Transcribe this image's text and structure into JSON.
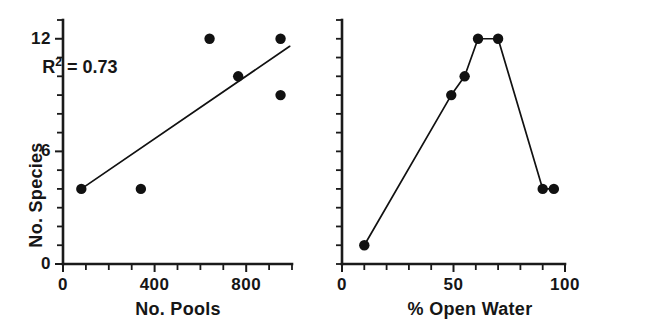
{
  "figure": {
    "background_color": "#ffffff",
    "ink_color": "#111111",
    "panel_count": 2
  },
  "chart_data": [
    {
      "type": "scatter",
      "panel": "left",
      "title": "",
      "xlabel": "No. Pools",
      "ylabel": "No. Species",
      "xlim": [
        0,
        1000
      ],
      "ylim": [
        0,
        13
      ],
      "grid": false,
      "legend": "none",
      "x_ticks": [
        0,
        100,
        200,
        300,
        400,
        500,
        600,
        700,
        800,
        900,
        1000
      ],
      "x_ticklabels": [
        {
          "value": 0,
          "label": "0"
        },
        {
          "value": 400,
          "label": "400"
        },
        {
          "value": 800,
          "label": "800"
        }
      ],
      "y_ticks": [
        0,
        1,
        2,
        3,
        4,
        5,
        6,
        7,
        8,
        9,
        10,
        11,
        12,
        13
      ],
      "y_ticklabels": [
        {
          "value": 0,
          "label": "0"
        },
        {
          "value": 6,
          "label": "6"
        },
        {
          "value": 12,
          "label": "12"
        }
      ],
      "points": [
        {
          "x": 80,
          "y": 4
        },
        {
          "x": 340,
          "y": 4
        },
        {
          "x": 640,
          "y": 12
        },
        {
          "x": 765,
          "y": 10
        },
        {
          "x": 950,
          "y": 12
        },
        {
          "x": 950,
          "y": 9
        }
      ],
      "trendline": {
        "x_start": 80,
        "y_start": 4,
        "x_end": 990,
        "y_end": 11.6
      },
      "annotations": [
        {
          "text_prefix": "R",
          "text_sup": "2",
          "text_suffix": " = 0.73",
          "plain": "R2 = 0.73",
          "x": 250,
          "y": 10.6
        }
      ]
    },
    {
      "type": "line",
      "panel": "right",
      "title": "",
      "xlabel": "% Open Water",
      "ylabel": "",
      "xlim": [
        0,
        100
      ],
      "ylim": [
        0,
        13
      ],
      "grid": false,
      "legend": "none",
      "markers": true,
      "x_ticks": [
        0,
        10,
        20,
        30,
        40,
        50,
        60,
        70,
        80,
        90,
        100
      ],
      "x_ticklabels": [
        {
          "value": 0,
          "label": "0"
        },
        {
          "value": 50,
          "label": "50"
        },
        {
          "value": 100,
          "label": "100"
        }
      ],
      "y_ticks": [
        0,
        1,
        2,
        3,
        4,
        5,
        6,
        7,
        8,
        9,
        10,
        11,
        12,
        13
      ],
      "y_ticklabels": [],
      "points": [
        {
          "x": 10,
          "y": 1
        },
        {
          "x": 49,
          "y": 9
        },
        {
          "x": 55,
          "y": 10
        },
        {
          "x": 61,
          "y": 12
        },
        {
          "x": 70,
          "y": 12
        },
        {
          "x": 90,
          "y": 4
        },
        {
          "x": 95,
          "y": 4
        }
      ]
    }
  ]
}
